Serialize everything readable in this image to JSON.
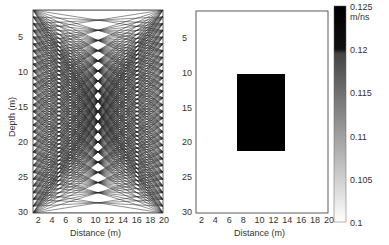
{
  "chart_data": [
    {
      "type": "line",
      "title": "Ray coverage",
      "xlabel": "Distance (m)",
      "ylabel": "Depth (m)",
      "xticks": [
        2,
        4,
        6,
        8,
        10,
        12,
        14,
        16,
        18,
        20
      ],
      "yticks": [
        5,
        10,
        15,
        20,
        25,
        30
      ],
      "xlim": [
        1,
        20
      ],
      "ylim": [
        30,
        1
      ],
      "description": "Dense straight ray paths between boreholes at x=1 and x=20, densest in region x 6-15, depth 10-21"
    },
    {
      "type": "heatmap",
      "xlabel": "Distance (m)",
      "ylabel": "",
      "xticks": [
        2,
        4,
        6,
        8,
        10,
        12,
        14,
        16,
        18,
        20
      ],
      "yticks": [
        5,
        10,
        15,
        20,
        25,
        30
      ],
      "xlim": [
        1,
        20
      ],
      "ylim": [
        30,
        1
      ],
      "background_value": 0.1,
      "anomaly": {
        "x": [
          7.5,
          14.5
        ],
        "depth": [
          10,
          21
        ],
        "value": 0.125
      },
      "colorbar": {
        "ticks": [
          0.1,
          0.105,
          0.11,
          0.115,
          0.12,
          0.125
        ],
        "unit": "m/ns",
        "top_label": "0.125 m/ns",
        "range": [
          0.1,
          0.125
        ]
      }
    }
  ],
  "labels": {
    "left_xlabel": "Distance (m)",
    "left_ylabel": "Depth (m)",
    "right_xlabel": "Distance (m)",
    "xticks": [
      "2",
      "4",
      "6",
      "8",
      "10",
      "12",
      "14",
      "16",
      "18",
      "20"
    ],
    "yticks": [
      "5",
      "10",
      "15",
      "20",
      "25",
      "30"
    ],
    "cbar": [
      "0.125 m/ns",
      "0.12",
      "0.115",
      "0.11",
      "0.105",
      "0.1"
    ]
  }
}
